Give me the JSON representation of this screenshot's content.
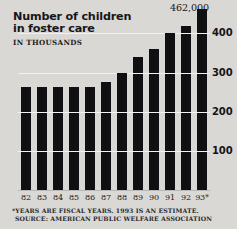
{
  "title": "Number of children\nin foster care",
  "subtitle": "IN THOUSANDS",
  "peak_callout": "462,000",
  "footnotes": {
    "estimate_note": "*YEARS ARE FISCAL YEARS. 1993 IS AN ESTIMATE.",
    "source": "SOURCE: AMERICAN PUBLIC WELFARE ASSOCIATION"
  },
  "colors": {
    "background": "#d9d8d4",
    "bar": "#100f12",
    "gridline": "#f2f1ee",
    "text": "#17161a"
  },
  "chart_data": {
    "type": "bar",
    "title": "Number of children in foster care",
    "subtitle": "IN THOUSANDS",
    "xlabel": "",
    "ylabel": "IN THOUSANDS",
    "ylim": [
      0,
      470
    ],
    "grid": true,
    "legend": "none",
    "yticks": [
      100,
      200,
      300,
      400
    ],
    "ytick_labels": [
      "100",
      "200",
      "300",
      "400"
    ],
    "categories": [
      "82",
      "83",
      "84",
      "85",
      "86",
      "87",
      "88",
      "89",
      "90",
      "91",
      "92",
      "93*"
    ],
    "values": [
      262,
      262,
      262,
      262,
      262,
      275,
      300,
      340,
      360,
      400,
      420,
      462
    ],
    "annotations": [
      {
        "label": "462,000",
        "category": "93*",
        "value": 462
      }
    ],
    "notes": [
      "*YEARS ARE FISCAL YEARS. 1993 IS AN ESTIMATE.",
      "SOURCE: AMERICAN PUBLIC WELFARE ASSOCIATION"
    ]
  }
}
